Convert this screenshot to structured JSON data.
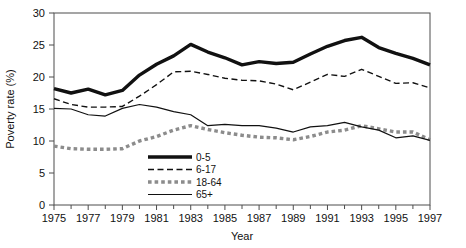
{
  "chart_data": {
    "type": "line",
    "title": "",
    "xlabel": "Year",
    "ylabel": "Poverty rate (%)",
    "xlim": [
      1975,
      1997
    ],
    "ylim": [
      0,
      30
    ],
    "yticks": [
      0,
      5,
      10,
      15,
      20,
      25,
      30
    ],
    "xticks": [
      1975,
      1977,
      1979,
      1981,
      1983,
      1985,
      1987,
      1989,
      1991,
      1993,
      1995,
      1997
    ],
    "xticks_minor": [
      1976,
      1978,
      1980,
      1982,
      1984,
      1986,
      1988,
      1990,
      1992,
      1994,
      1996
    ],
    "grid": false,
    "legend_position": "inside lower-center-left",
    "x": [
      1975,
      1976,
      1977,
      1978,
      1979,
      1980,
      1981,
      1982,
      1983,
      1984,
      1985,
      1986,
      1987,
      1988,
      1989,
      1990,
      1991,
      1992,
      1993,
      1994,
      1995,
      1996,
      1997
    ],
    "series": [
      {
        "name": "0-5",
        "style": "thick-solid",
        "color": "#111111",
        "width": 3.4,
        "values": [
          18.2,
          17.5,
          18.1,
          17.2,
          17.9,
          20.3,
          22.0,
          23.3,
          25.1,
          23.9,
          23.0,
          21.9,
          22.4,
          22.1,
          22.3,
          23.6,
          24.8,
          25.7,
          26.2,
          24.6,
          23.7,
          22.9,
          21.9
        ]
      },
      {
        "name": "6-17",
        "style": "dashed",
        "color": "#111111",
        "width": 1.4,
        "values": [
          16.6,
          15.7,
          15.3,
          15.3,
          15.4,
          17.0,
          18.8,
          20.8,
          20.9,
          20.4,
          19.8,
          19.5,
          19.4,
          18.9,
          18.0,
          19.2,
          20.4,
          20.1,
          21.2,
          20.1,
          19.0,
          19.1,
          18.3
        ]
      },
      {
        "name": "18-64",
        "style": "thick-dotted",
        "color": "#8c8c8c",
        "width": 3.4,
        "values": [
          9.2,
          8.8,
          8.7,
          8.7,
          8.8,
          10.0,
          10.7,
          11.7,
          12.4,
          11.8,
          11.3,
          10.9,
          10.6,
          10.5,
          10.2,
          10.7,
          11.4,
          11.7,
          12.4,
          11.9,
          11.4,
          11.4,
          10.2
        ]
      },
      {
        "name": "65+",
        "style": "thin-solid",
        "color": "#111111",
        "width": 1.2,
        "values": [
          15.1,
          15.0,
          14.1,
          13.9,
          15.1,
          15.7,
          15.3,
          14.6,
          14.1,
          12.4,
          12.6,
          12.4,
          12.4,
          12.0,
          11.4,
          12.2,
          12.4,
          12.9,
          12.2,
          11.7,
          10.5,
          10.8,
          10.1
        ]
      }
    ],
    "legend": [
      {
        "label": "0-5",
        "style": "thick-solid",
        "color": "#111111"
      },
      {
        "label": "6-17",
        "style": "dashed",
        "color": "#111111"
      },
      {
        "label": "18-64",
        "style": "thick-dotted",
        "color": "#8c8c8c"
      },
      {
        "label": "65+",
        "style": "thin-solid",
        "color": "#111111"
      }
    ]
  }
}
